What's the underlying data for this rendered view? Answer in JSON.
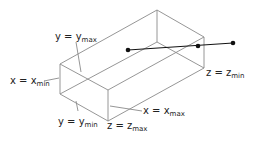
{
  "figure": {
    "labels": {
      "y_max": {
        "var": "y",
        "eq": " = ",
        "rhs": "y",
        "sub": "max"
      },
      "x_min": {
        "var": "x",
        "eq": " = ",
        "rhs": "x",
        "sub": "min"
      },
      "y_min": {
        "var": "y",
        "eq": " = ",
        "rhs": "y",
        "sub": "min"
      },
      "z_max": {
        "var": "z",
        "eq": " = ",
        "rhs": "z",
        "sub": "max"
      },
      "x_max": {
        "var": "x",
        "eq": " = ",
        "rhs": "x",
        "sub": "max"
      },
      "z_min": {
        "var": "z",
        "eq": " = ",
        "rhs": "z",
        "sub": "min"
      }
    },
    "colors": {
      "edges": "#888888",
      "segment": "#111111",
      "text": "#222222"
    }
  }
}
